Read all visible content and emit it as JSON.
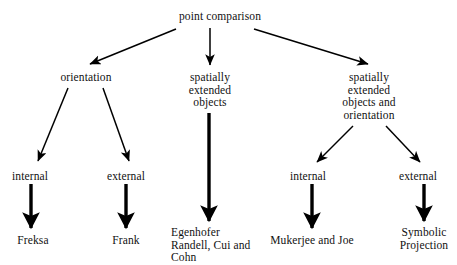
{
  "diagram": {
    "title": "point comparison",
    "type": "hierarchy-tree",
    "nodes": {
      "root": "point comparison",
      "level1": {
        "orientation": "orientation",
        "spatially_extended_objects": "spatially\nextended\nobjects",
        "spatially_extended_objects_and_orientation": "spatially\nextended\nobjects and\norientation"
      },
      "level2": {
        "internal_left": "internal",
        "external_left": "external",
        "internal_right": "internal",
        "external_right": "external"
      },
      "leaves": {
        "freksa": "Freksa",
        "frank": "Frank",
        "egenhofer": "Egenhofer\nRandell, Cui and\nCohn",
        "mukerjee": "Mukerjee and Joe",
        "symbolic_projection": "Symbolic\nProjection"
      }
    },
    "colors": {
      "background": "#ffffff",
      "text": "#111111",
      "stroke": "#000000"
    }
  }
}
